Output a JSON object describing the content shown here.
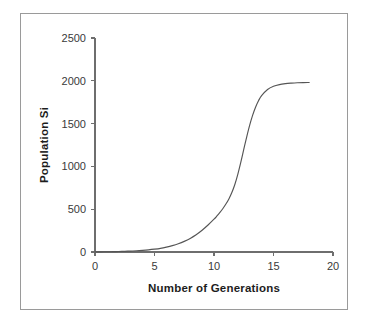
{
  "chart_data": {
    "type": "line",
    "title": "",
    "xlabel": "Number of Generations",
    "ylabel": "Population Si",
    "xlim": [
      0,
      20
    ],
    "ylim": [
      0,
      2500
    ],
    "xticks": [
      0,
      5,
      10,
      15,
      20
    ],
    "yticks": [
      0,
      500,
      1000,
      1500,
      2000,
      2500
    ],
    "xtick_labels": [
      "0",
      "5",
      "10",
      "15",
      "20"
    ],
    "ytick_labels": [
      "0",
      "500",
      "1000",
      "1500",
      "2000",
      "2500"
    ],
    "grid": false,
    "legend": false,
    "legend_position": "none",
    "line_color": "#555555",
    "frame_color": "#9a9a9a",
    "axis_color": "#6e6e6e",
    "background_color": "#ffffff",
    "series": [
      {
        "name": "Population Si",
        "x": [
          0,
          0.5,
          1,
          1.5,
          2,
          2.5,
          3,
          3.5,
          4,
          4.5,
          5,
          5.5,
          6,
          6.5,
          7,
          7.5,
          8,
          8.5,
          9,
          9.5,
          10,
          10.25,
          10.5,
          10.75,
          11,
          11.25,
          11.5,
          11.75,
          12,
          12.25,
          12.5,
          12.75,
          13,
          13.25,
          13.5,
          13.75,
          14,
          14.5,
          15,
          15.5,
          16,
          16.5,
          17,
          17.5,
          18
        ],
        "y": [
          1,
          2,
          3,
          4,
          6,
          8,
          11,
          14,
          19,
          25,
          33,
          43,
          57,
          74,
          96,
          124,
          159,
          202,
          254,
          315,
          383,
          421,
          462,
          508,
          560,
          620,
          694,
          789,
          908,
          1048,
          1198,
          1346,
          1482,
          1599,
          1694,
          1770,
          1826,
          1898,
          1936,
          1956,
          1967,
          1973,
          1977,
          1979,
          1980
        ]
      }
    ]
  },
  "axes": {
    "x_axis_name": "x-axis",
    "y_axis_name": "y-axis"
  }
}
